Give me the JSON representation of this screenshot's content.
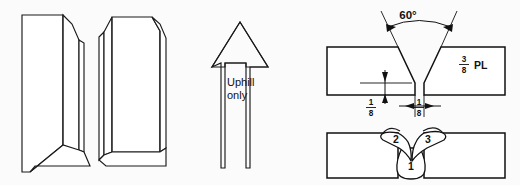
{
  "figure": {
    "background_color": "#fbfbfb",
    "line_color": "#111111"
  },
  "panels": {
    "left": {
      "name": "beveled-plates-isometric",
      "description": "Two beveled plate ends shown in isometric view forming a V-groove"
    },
    "middle": {
      "name": "uphill-direction-arrow",
      "label_line1": "Uphill",
      "label_line2": "only"
    },
    "right_top": {
      "name": "joint-preparation-section",
      "groove_angle": "60°",
      "root_face_label": {
        "numerator": "1",
        "denominator": "8"
      },
      "root_opening_label": {
        "numerator": "1",
        "denominator": "8"
      },
      "plate_thickness": {
        "numerator": "3",
        "denominator": "8",
        "unit": "PL"
      }
    },
    "right_bottom": {
      "name": "weld-pass-sequence-section",
      "passes": [
        {
          "number": "1",
          "name": "root-pass"
        },
        {
          "number": "2",
          "name": "second-pass"
        },
        {
          "number": "3",
          "name": "third-pass"
        }
      ]
    }
  }
}
